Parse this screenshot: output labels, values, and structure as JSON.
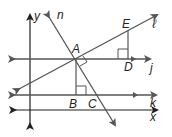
{
  "diagram": {
    "type": "geometry-coordinate-lines",
    "colors": {
      "line": "#555555",
      "axis": "#231f20",
      "text": "#231f20"
    },
    "axes": {
      "x_label": "x",
      "y_label": "y"
    },
    "lines": [
      {
        "name": "n",
        "label": "n"
      },
      {
        "name": "l",
        "label": "ℓ"
      },
      {
        "name": "j",
        "label": "j"
      },
      {
        "name": "k",
        "label": "k"
      }
    ],
    "points": [
      {
        "name": "A",
        "label": "A"
      },
      {
        "name": "B",
        "label": "B"
      },
      {
        "name": "C",
        "label": "C"
      },
      {
        "name": "D",
        "label": "D"
      },
      {
        "name": "E",
        "label": "E"
      }
    ],
    "right_angles": [
      "at A between n and ℓ",
      "at B",
      "at D"
    ]
  }
}
